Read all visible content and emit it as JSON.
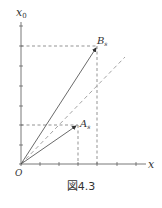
{
  "figure": {
    "caption": "図4.3",
    "axes": {
      "x_label": "x",
      "y_label": "x₀",
      "origin_label": "O"
    },
    "points": {
      "A": {
        "label": "A",
        "sub": "s"
      },
      "B": {
        "label": "B",
        "sub": "s"
      }
    },
    "colors": {
      "axis": "#555555",
      "vector": "#444444",
      "dashed_guide": "#777777",
      "diagonal": "#aaaaaa"
    }
  }
}
